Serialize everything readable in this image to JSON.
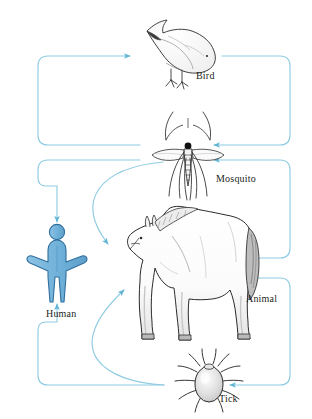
{
  "diagram": {
    "type": "cycle-diagram",
    "canvas": {
      "width": 312,
      "height": 419
    },
    "colors": {
      "arrow": "#7ec7e0",
      "arrow_dark": "#5fb4d6",
      "human_fill": "#74b3dc",
      "human_stroke": "#2f6f9f",
      "outline": "#231f20",
      "background": "#ffffff",
      "label_text": "#231f20",
      "animal_shade": "#d9d9d9",
      "tick_shade": "#d0d0d0"
    },
    "nodes": [
      {
        "id": "bird",
        "label": "Bird",
        "icon": "bird-icon",
        "x": 196,
        "y": 70
      },
      {
        "id": "mosquito",
        "label": "Mosquito",
        "icon": "mosquito-icon",
        "x": 216,
        "y": 173
      },
      {
        "id": "animal",
        "label": "Animal",
        "icon": "horse-icon",
        "x": 246,
        "y": 293
      },
      {
        "id": "human",
        "label": "Human",
        "icon": "human-icon",
        "x": 46,
        "y": 308
      },
      {
        "id": "tick",
        "label": "Tick",
        "icon": "tick-icon",
        "x": 219,
        "y": 393
      }
    ],
    "edges": [
      {
        "id": "mosquito-to-bird",
        "from": "mosquito",
        "to": "bird",
        "style": "loop-left"
      },
      {
        "id": "bird-to-mosquito",
        "from": "bird",
        "to": "mosquito",
        "style": "loop-right"
      },
      {
        "id": "mosquito-to-human",
        "from": "mosquito",
        "to": "human",
        "style": "loop-left"
      },
      {
        "id": "mosquito-to-animal",
        "from": "mosquito",
        "to": "animal",
        "style": "curve"
      },
      {
        "id": "animal-to-mosquito",
        "from": "animal",
        "to": "mosquito",
        "style": "loop-right"
      },
      {
        "id": "tick-to-animal",
        "from": "tick",
        "to": "animal",
        "style": "curve"
      },
      {
        "id": "animal-to-tick",
        "from": "animal",
        "to": "tick",
        "style": "loop-right"
      },
      {
        "id": "tick-to-human",
        "from": "tick",
        "to": "human",
        "style": "loop-left"
      }
    ]
  }
}
